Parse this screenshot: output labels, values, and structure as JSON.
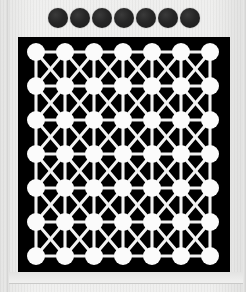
{
  "figure": {
    "background_color": "#ececeb",
    "panel_color": "#000000",
    "node_color": "#fbfbfb",
    "edge_color": "#f2f2f2",
    "legend_dot_color": "#262626"
  },
  "legend": {
    "name": "legend-dot-row",
    "count": 7,
    "dot_diameter_px": 20,
    "dot_gap_px": 2,
    "dots": [
      {
        "index": 1,
        "label": ""
      },
      {
        "index": 2,
        "label": ""
      },
      {
        "index": 3,
        "label": ""
      },
      {
        "index": 4,
        "label": ""
      },
      {
        "index": 5,
        "label": ""
      },
      {
        "index": 6,
        "label": ""
      },
      {
        "index": 7,
        "label": ""
      }
    ]
  },
  "chart_data": {
    "type": "scatter",
    "title": "",
    "subtitle": "",
    "xlabel": "",
    "ylabel": "",
    "grid": true,
    "legend_position": "top",
    "rows": 7,
    "cols": 7,
    "node_count": 49,
    "node_radius_px": 9,
    "col_spacing_px": 29,
    "row_spacing_px": 34,
    "origin_x_px": 18,
    "origin_y_px": 15,
    "xlim": [
      1,
      7
    ],
    "ylim": [
      1,
      7
    ],
    "xticklabels": [
      "1",
      "2",
      "3",
      "4",
      "5",
      "6",
      "7"
    ],
    "yticklabels": [
      "1",
      "2",
      "3",
      "4",
      "5",
      "6",
      "7"
    ],
    "edge_types": [
      "horizontal",
      "vertical",
      "diagonal-down",
      "diagonal-up"
    ],
    "x": [
      1,
      2,
      3,
      4,
      5,
      6,
      7,
      1,
      2,
      3,
      4,
      5,
      6,
      7,
      1,
      2,
      3,
      4,
      5,
      6,
      7,
      1,
      2,
      3,
      4,
      5,
      6,
      7,
      1,
      2,
      3,
      4,
      5,
      6,
      7,
      1,
      2,
      3,
      4,
      5,
      6,
      7,
      1,
      2,
      3,
      4,
      5,
      6,
      7
    ],
    "y": [
      1,
      1,
      1,
      1,
      1,
      1,
      1,
      2,
      2,
      2,
      2,
      2,
      2,
      2,
      3,
      3,
      3,
      3,
      3,
      3,
      3,
      4,
      4,
      4,
      4,
      4,
      4,
      4,
      5,
      5,
      5,
      5,
      5,
      5,
      5,
      6,
      6,
      6,
      6,
      6,
      6,
      6,
      7,
      7,
      7,
      7,
      7,
      7,
      7
    ],
    "values": [
      1,
      1,
      1,
      1,
      1,
      1,
      1,
      1,
      1,
      1,
      1,
      1,
      1,
      1,
      1,
      1,
      1,
      1,
      1,
      1,
      1,
      1,
      1,
      1,
      1,
      1,
      1,
      1,
      1,
      1,
      1,
      1,
      1,
      1,
      1,
      1,
      1,
      1,
      1,
      1,
      1,
      1,
      1,
      1,
      1,
      1,
      1,
      1,
      1
    ]
  }
}
